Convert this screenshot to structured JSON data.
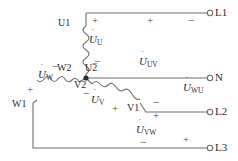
{
  "diagram": {
    "stroke_color": "#6e6e6e",
    "text_color": "#2e2e2e",
    "background": "#ffffff"
  },
  "terminals": [
    {
      "id": "L1",
      "label": "L1",
      "x": 214,
      "y": 13
    },
    {
      "id": "N",
      "label": "N",
      "x": 214,
      "y": 78
    },
    {
      "id": "L2",
      "label": "L2",
      "x": 214,
      "y": 112
    },
    {
      "id": "L3",
      "label": "L3",
      "x": 214,
      "y": 150
    }
  ],
  "windings": [
    {
      "id": "U",
      "start_label": "U1",
      "end_label": "U2",
      "phasor": "U",
      "sub": "U"
    },
    {
      "id": "V",
      "start_label": "V1",
      "end_label": "V2",
      "phasor": "U",
      "sub": "V"
    },
    {
      "id": "W",
      "start_label": "W1",
      "end_label": "W2",
      "phasor": "U",
      "sub": "W"
    }
  ],
  "winding_labels": [
    {
      "name": "U1",
      "text": "U1",
      "x": 63,
      "y": 23
    },
    {
      "name": "U2",
      "text": "U2",
      "x": 89,
      "y": 68
    },
    {
      "name": "W2",
      "text": "W2",
      "x": 62,
      "y": 68
    },
    {
      "name": "V2",
      "text": "V2",
      "x": 79,
      "y": 85
    },
    {
      "name": "W1",
      "text": "W1",
      "x": 17,
      "y": 104
    },
    {
      "name": "V1",
      "text": "V1",
      "x": 131,
      "y": 108
    }
  ],
  "phasors": [
    {
      "name": "u-phase-voltage",
      "base": "U",
      "sub": "U",
      "x": 95,
      "y": 40
    },
    {
      "name": "w-phase-voltage",
      "base": "U",
      "sub": "W",
      "x": 44,
      "y": 75
    },
    {
      "name": "v-phase-voltage",
      "base": "U",
      "sub": "V",
      "x": 96,
      "y": 100
    },
    {
      "name": "uv-line-voltage",
      "base": "U",
      "sub": "UV",
      "x": 146,
      "y": 62
    },
    {
      "name": "wu-line-voltage",
      "base": "U",
      "sub": "WU",
      "x": 190,
      "y": 88
    },
    {
      "name": "vw-line-voltage",
      "base": "U",
      "sub": "VW",
      "x": 143,
      "y": 130
    }
  ],
  "polarity_marks": [
    {
      "name": "plus-u-top",
      "sign": "+",
      "x": 95,
      "y": 20
    },
    {
      "name": "plus-uv-top",
      "sign": "+",
      "x": 150,
      "y": 20
    },
    {
      "name": "minus-uv-top",
      "sign": "−",
      "x": 191,
      "y": 20
    },
    {
      "name": "minus-u-bottom",
      "sign": "−",
      "x": 97,
      "y": 60
    },
    {
      "name": "minus-w2",
      "sign": "−",
      "x": 56,
      "y": 64
    },
    {
      "name": "plus-w-left",
      "sign": "+",
      "x": 30,
      "y": 89
    },
    {
      "name": "minus-v-top",
      "sign": "−",
      "x": 86,
      "y": 92
    },
    {
      "name": "plus-v-right",
      "sign": "+",
      "x": 115,
      "y": 108
    },
    {
      "name": "minus-l2",
      "sign": "−",
      "x": 156,
      "y": 101
    },
    {
      "name": "plus-l2",
      "sign": "+",
      "x": 156,
      "y": 115
    },
    {
      "name": "minus-l3",
      "sign": "−",
      "x": 143,
      "y": 141
    },
    {
      "name": "plus-l3",
      "sign": "+",
      "x": 186,
      "y": 139
    }
  ],
  "node": {
    "name": "star-point",
    "x": 86,
    "y": 78,
    "radius": 2.6
  }
}
